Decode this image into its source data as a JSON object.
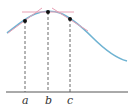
{
  "diagram": {
    "type": "curve-with-tangent-lines",
    "colors": {
      "curve": "#6fb3d2",
      "tangent": "#e8a0b4",
      "point": "#111111",
      "axis": "#555555",
      "dashed": "#444444",
      "label": "#333333"
    },
    "points": [
      {
        "label": "a",
        "x": 25,
        "y": 21
      },
      {
        "label": "b",
        "x": 48,
        "y": 12
      },
      {
        "label": "c",
        "x": 70,
        "y": 19
      }
    ],
    "axis": {
      "y": 92,
      "x_start": 6,
      "x_end": 128
    },
    "labels": {
      "a": "a",
      "b": "b",
      "c": "c"
    }
  }
}
